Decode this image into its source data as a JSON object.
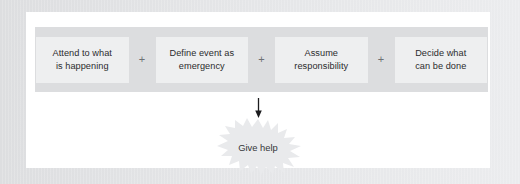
{
  "figure": {
    "chain": {
      "steps": [
        {
          "line1": "Attend to what",
          "line2": "is happening"
        },
        {
          "line1": "Define event as",
          "line2": "emergency"
        },
        {
          "line1": "Assume",
          "line2": "responsibility"
        },
        {
          "line1": "Decide what",
          "line2": "can be done"
        }
      ],
      "connector": "+"
    },
    "arrow": {
      "direction": "down",
      "icon": "arrow-down-icon"
    },
    "outcome": {
      "label": "Give help",
      "shape": "starburst"
    }
  },
  "colors": {
    "page_background": "#e1e2e4",
    "card_background": "#ffffff",
    "band_background": "#dcdddf",
    "step_background": "#eeeff0",
    "burst_fill": "#e9eaec",
    "text": "#2b2b2d",
    "plus": "#6e7073",
    "arrow": "#1c1c1e"
  }
}
